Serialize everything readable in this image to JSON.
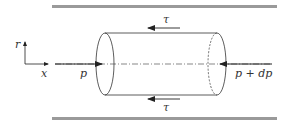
{
  "diagram": {
    "type": "fluid-element-in-pipe",
    "labels": {
      "shear_top": "τ",
      "shear_bottom": "τ",
      "pressure_left": "p",
      "pressure_right": "p + dp",
      "axis_r": "r",
      "axis_x": "x"
    },
    "colors": {
      "wall": "#9a9a9a",
      "line": "#333333",
      "background": "#ffffff"
    }
  }
}
